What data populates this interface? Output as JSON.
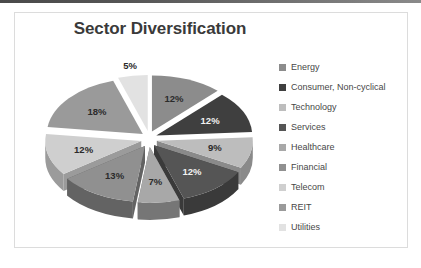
{
  "window": {
    "top_strip_color": "#555555",
    "frame_border_color": "#dcdcdc",
    "background": "#ffffff"
  },
  "chart_data": {
    "type": "pie",
    "title": "Sector Diversification",
    "xlabel": "",
    "ylabel": "",
    "exploded": true,
    "three_d": true,
    "legend_position": "right",
    "grid": false,
    "categories": [
      "Energy",
      "Consumer, Non-cyclical",
      "Technology",
      "Services",
      "Healthcare",
      "Financial",
      "Telecom",
      "REIT",
      "Utilities"
    ],
    "values": [
      12,
      12,
      9,
      12,
      7,
      13,
      12,
      18,
      5
    ],
    "labels": [
      "12%",
      "12%",
      "9%",
      "12%",
      "7%",
      "13%",
      "12%",
      "18%",
      "5%"
    ],
    "colors": [
      "#8c8c8c",
      "#3f3f3f",
      "#bdbdbd",
      "#555555",
      "#a8a8a8",
      "#909090",
      "#cfcfcf",
      "#9a9a9a",
      "#e2e2e2"
    ],
    "side_colors": [
      "#5e5e5e",
      "#2a2a2a",
      "#8a8a8a",
      "#3a3a3a",
      "#767676",
      "#636363",
      "#9b9b9b",
      "#6b6b6b",
      "#aeaeae"
    ]
  },
  "legend": {
    "items": [
      {
        "label": "Energy",
        "color": "#8c8c8c"
      },
      {
        "label": "Consumer, Non-cyclical",
        "color": "#3f3f3f"
      },
      {
        "label": "Technology",
        "color": "#bdbdbd"
      },
      {
        "label": "Services",
        "color": "#555555"
      },
      {
        "label": "Healthcare",
        "color": "#a8a8a8"
      },
      {
        "label": "Financial",
        "color": "#909090"
      },
      {
        "label": "Telecom",
        "color": "#cfcfcf"
      },
      {
        "label": "REIT",
        "color": "#9a9a9a"
      },
      {
        "label": "Utilities",
        "color": "#e2e2e2"
      }
    ]
  }
}
